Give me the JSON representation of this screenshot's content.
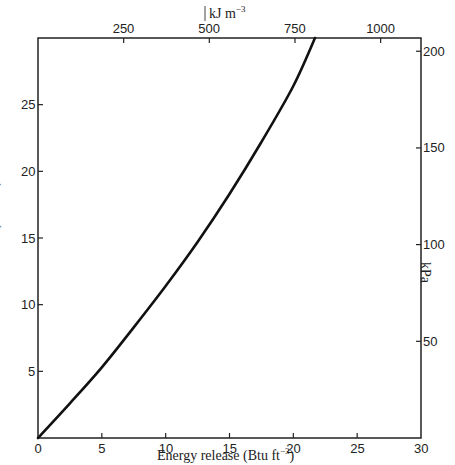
{
  "chart_data": {
    "type": "line",
    "title": "",
    "xlabel": "Energy release (Btu ft⁻³)",
    "ylabel": "Pressure rise (lbf in⁻²)",
    "secondary_xlabel": "kJ m⁻³",
    "secondary_ylabel": "kPa",
    "xlim": [
      0,
      30
    ],
    "ylim": [
      0,
      30
    ],
    "x_ticks": [
      0,
      5,
      10,
      15,
      20,
      25,
      30
    ],
    "y_ticks": [
      5,
      10,
      15,
      20,
      25
    ],
    "secondary_x_ticks": [
      250,
      500,
      750,
      1000
    ],
    "secondary_y_ticks": [
      50,
      100,
      150,
      200
    ],
    "grid": false,
    "legend": null,
    "series": [
      {
        "name": "Pressure rise vs energy release",
        "x": [
          0,
          2.5,
          5,
          7.5,
          10,
          12.5,
          15,
          17.5,
          20,
          21.7
        ],
        "y": [
          0,
          2.6,
          5.3,
          8.3,
          11.4,
          14.7,
          18.3,
          22.2,
          26.4,
          30
        ]
      }
    ]
  },
  "labels": {
    "x_axis_title": "Energy release (Btu ft",
    "x_axis_title_sup": "−3",
    "x_axis_title_end": ")",
    "y_axis_title": "Pressure rise (lbf in",
    "y_axis_title_sup": "−2",
    "y_axis_title_end": ")",
    "top_axis_unit": "kJ m",
    "top_axis_unit_sup": "−3",
    "right_axis_unit": "kPa"
  },
  "ticks": {
    "bottom": [
      "0",
      "5",
      "10",
      "15",
      "20",
      "25",
      "30"
    ],
    "left": [
      "5",
      "10",
      "15",
      "20",
      "25"
    ],
    "top": [
      "250",
      "500",
      "750",
      "1000"
    ],
    "right": [
      "50",
      "100",
      "150",
      "200"
    ]
  }
}
